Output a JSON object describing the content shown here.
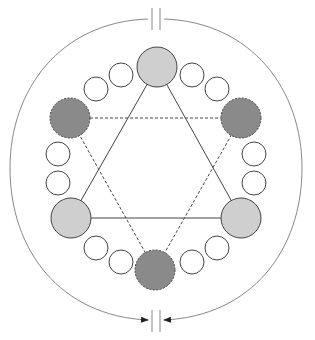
{
  "diagram": {
    "colors": {
      "outline": "#444444",
      "light_fill": "#cfcfcf",
      "dark_fill": "#8a8a8a",
      "small_fill": "#ffffff",
      "arc": "#888888"
    },
    "center": [
      156,
      168
    ],
    "large_solid": [
      [
        157,
        67
      ],
      [
        71,
        218
      ],
      [
        241,
        218
      ]
    ],
    "large_dashed": [
      [
        70,
        118
      ],
      [
        241,
        118
      ],
      [
        155,
        270
      ]
    ],
    "small": [
      [
        121,
        75
      ],
      [
        96,
        89
      ],
      [
        192,
        75
      ],
      [
        217,
        89
      ],
      [
        58,
        154
      ],
      [
        58,
        183
      ],
      [
        254,
        154
      ],
      [
        254,
        183
      ],
      [
        96,
        248
      ],
      [
        121,
        262
      ],
      [
        217,
        248
      ],
      [
        192,
        262
      ]
    ],
    "gap_markers": {
      "top_y": 19,
      "bottom_y": 320,
      "x": [
        152,
        160
      ]
    }
  }
}
